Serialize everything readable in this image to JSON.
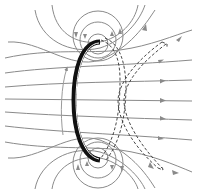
{
  "diagram": {
    "title": "",
    "colors": {
      "background": "#ffffff",
      "field_line": "#8a8a8a",
      "loop_front": "#111111",
      "loop_highlight": "#ffffff",
      "loop_back_dashed": "#333333"
    },
    "elements": {
      "loop_front": "solid wire arc (front half of loop)",
      "loop_back": "dashed wire arc (rear half of loop)",
      "field_lines": "curved field lines passing through loop center, arrows pointing right",
      "field_circles_top": "concentric field circles around top wire crossing",
      "field_circles_bottom": "concentric field circles around bottom wire crossing",
      "current_arrow": "curved arrow left of loop pointing up"
    },
    "labels": []
  }
}
